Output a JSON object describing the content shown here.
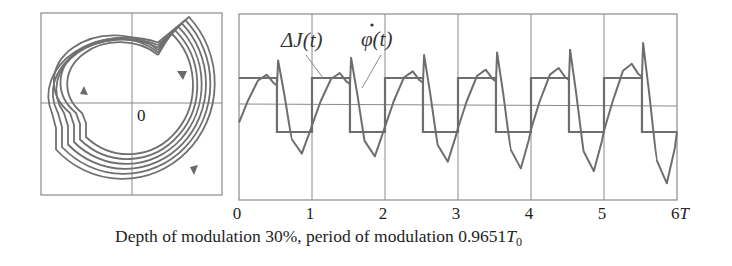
{
  "chart_data": [
    {
      "type": "phase-portrait",
      "panel": "left",
      "title": "",
      "origin_label": "0",
      "grid": "crosshair through origin",
      "loops": 6,
      "direction": "clockwise",
      "arrows": 3
    },
    {
      "type": "line",
      "panel": "right",
      "title": "",
      "xlabel": "",
      "x_ticks": [
        "0",
        "1",
        "2",
        "3",
        "4",
        "5",
        "6T"
      ],
      "xlim": [
        0,
        6
      ],
      "grid": true,
      "series": [
        {
          "name": "ΔJ(t)",
          "kind": "square wave",
          "high": 1,
          "low": -1,
          "switch_fraction": 0.52,
          "periods": 6
        },
        {
          "name": "φ̇(t)",
          "kind": "growing oscillation with spike before drop",
          "periods": 6,
          "peak_spike": [
            1.65,
            1.75,
            1.85,
            1.95,
            2.05,
            2.3
          ],
          "minimum": [
            -1.8,
            -1.9,
            -2.1,
            -2.35,
            -2.45,
            -2.9
          ]
        }
      ],
      "annotations": [
        "ΔJ(t)",
        "φ̇(t)"
      ]
    }
  ],
  "caption": {
    "prefix": "Depth of modulation 30%, period of modulation 0.9651",
    "symbol": "T",
    "subscript": "0"
  },
  "labels": {
    "delta_j": "ΔJ(t)",
    "phi_dot": "φ(t)",
    "origin": "0",
    "ticks": [
      "0",
      "1",
      "2",
      "3",
      "4",
      "5",
      "6T"
    ]
  }
}
